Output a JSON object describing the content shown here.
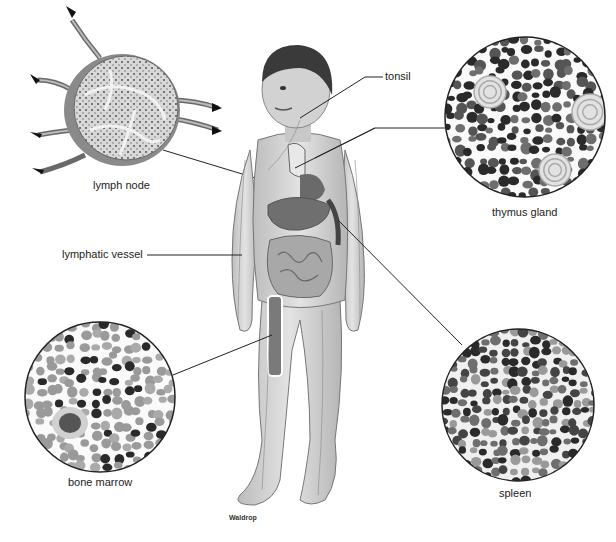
{
  "diagram": {
    "labels": {
      "lymph_node": "lymph node",
      "tonsil": "tonsil",
      "thymus_gland": "thymus gland",
      "lymphatic_vessel": "lymphatic vessel",
      "bone_marrow": "bone marrow",
      "spleen": "spleen"
    },
    "signature": "Waldrop",
    "insets": [
      {
        "id": "lymph_node",
        "label": "lymph node",
        "cx": 122,
        "cy": 108,
        "r": 62
      },
      {
        "id": "thymus_gland",
        "label": "thymus gland",
        "cx": 525,
        "cy": 117,
        "r": 80
      },
      {
        "id": "bone_marrow",
        "label": "bone marrow",
        "cx": 100,
        "cy": 397,
        "r": 75
      },
      {
        "id": "spleen",
        "label": "spleen",
        "cx": 518,
        "cy": 405,
        "r": 76
      }
    ],
    "colors": {
      "line": "#222222",
      "cell_dark": "#2a2a2a",
      "cell_mid": "#6e6e6e",
      "cell_light": "#9a9a9a",
      "skin": "#cfcfcf",
      "organ": "#7a7a7a"
    }
  }
}
